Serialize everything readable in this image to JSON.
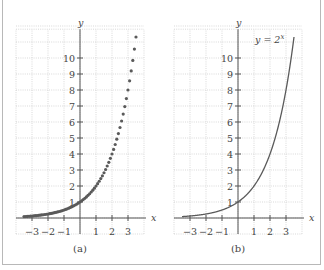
{
  "chart_data": [
    {
      "type": "scatter",
      "caption": "(a)",
      "function": "y = 2^x",
      "xlabel": "x",
      "ylabel": "y",
      "xlim": [
        -4,
        4
      ],
      "ylim": [
        -1,
        12
      ],
      "x_ticks": [
        -3,
        -2,
        -1,
        1,
        2,
        3
      ],
      "x_tick_labels": [
        "−3",
        "−2",
        "−1",
        "1",
        "2",
        "3"
      ],
      "y_ticks": [
        1,
        2,
        3,
        4,
        5,
        6,
        7,
        8,
        9,
        10
      ],
      "y_tick_labels": [
        "1",
        "2",
        "3",
        "4",
        "5",
        "6",
        "7",
        "8",
        "9",
        "10"
      ],
      "grid": true,
      "x_range": [
        -3.5,
        3.5
      ],
      "x_step": 0.1,
      "annotation": ""
    },
    {
      "type": "line",
      "caption": "(b)",
      "function": "y = 2^x",
      "xlabel": "x",
      "ylabel": "y",
      "xlim": [
        -4,
        4
      ],
      "ylim": [
        -1,
        12
      ],
      "x_ticks": [
        -3,
        -2,
        -1,
        1,
        2,
        3
      ],
      "x_tick_labels": [
        "−3",
        "−2",
        "−1",
        "1",
        "2",
        "3"
      ],
      "y_ticks": [
        1,
        2,
        3,
        4,
        5,
        6,
        7,
        8,
        9,
        10
      ],
      "y_tick_labels": [
        "1",
        "2",
        "3",
        "4",
        "5",
        "6",
        "7",
        "8",
        "9",
        "10"
      ],
      "grid": true,
      "x_range": [
        -3.5,
        3.5
      ],
      "annotation": "y = 2^x"
    }
  ],
  "panels": [
    {
      "caption": "(a)",
      "xlabel": "x",
      "ylabel": "y"
    },
    {
      "caption": "(b)",
      "xlabel": "x",
      "ylabel": "y",
      "curve_label_base": "y = 2",
      "curve_label_exp": "x"
    }
  ],
  "colors": {
    "data": "#5a5a5a",
    "axis": "#555555",
    "grid": "#c8c8c8",
    "frame": "#b8b8b8"
  }
}
